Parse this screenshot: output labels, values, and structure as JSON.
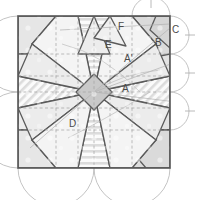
{
  "figure": {
    "canvas": {
      "width": 201,
      "height": 200,
      "background": "#ffffff"
    },
    "frame": {
      "name": "outer-square",
      "x": 18,
      "y": 16,
      "width": 152,
      "height": 152,
      "stroke": "#555555",
      "stroke_width": 1.6,
      "fill": "#efefef"
    },
    "palette": {
      "line_dark": "#4a4a4a",
      "line_mid": "#777777",
      "line_light": "#bbbbbb",
      "construction": "#9a9a9a",
      "fill_light": "#f2f2f2",
      "fill_mid": "#e2e2e2",
      "fill_dark": "#d2d2d2",
      "hatch": "#d8d8d8",
      "center_fill": "#c8c8c8",
      "label_color": "#4a4a4a"
    },
    "labels": [
      {
        "id": "A",
        "text": "A",
        "x": 122,
        "y": 92,
        "name": "region-label-a"
      },
      {
        "id": "Ap",
        "text": "A'",
        "x": 124,
        "y": 62,
        "name": "region-label-a-prime"
      },
      {
        "id": "B",
        "text": "B",
        "x": 155,
        "y": 46,
        "name": "region-label-b"
      },
      {
        "id": "C",
        "text": "C",
        "x": 172,
        "y": 33,
        "name": "region-label-c"
      },
      {
        "id": "D",
        "text": "D",
        "x": 69,
        "y": 127,
        "name": "region-label-d"
      },
      {
        "id": "E",
        "text": "E",
        "x": 105,
        "y": 48,
        "name": "region-label-e"
      },
      {
        "id": "F",
        "text": "F",
        "x": 118,
        "y": 30,
        "name": "region-label-f"
      }
    ],
    "geometry": {
      "center": {
        "x": 94,
        "y": 92
      },
      "star_points": 8,
      "grid_rows": 4,
      "grid_cols": 4,
      "edge_arcs": 8
    }
  }
}
